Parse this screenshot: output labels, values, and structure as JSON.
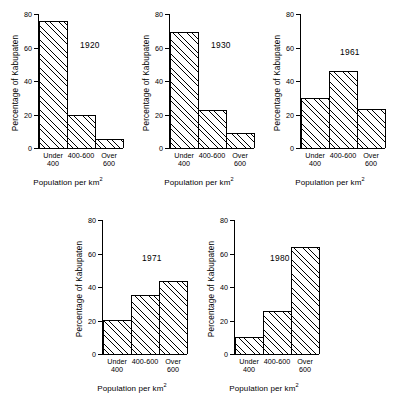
{
  "figure": {
    "axis": {
      "y_title": "Percentage of Kabupaten",
      "x_title_main": "Population per km",
      "x_title_sup": "2",
      "y_ticks": [
        "0",
        "20",
        "40",
        "60",
        "80"
      ]
    },
    "categories": [
      "Under\n400",
      "400-600",
      "Over\n600"
    ]
  },
  "chart_data": [
    {
      "type": "bar",
      "title": "1920",
      "categories": [
        "Under 400",
        "400-600",
        "Over 600"
      ],
      "values": [
        76,
        19.5,
        5.5
      ],
      "xlabel": "Population per km2",
      "ylabel": "Percentage of Kabupaten",
      "ylim": [
        0,
        80
      ],
      "yticks": [
        0,
        20,
        40,
        60,
        80
      ],
      "grid": false,
      "legend": "none"
    },
    {
      "type": "bar",
      "title": "1930",
      "categories": [
        "Under 400",
        "400-600",
        "Over 600"
      ],
      "values": [
        69,
        22.5,
        9
      ],
      "xlabel": "Population per km2",
      "ylabel": "Percentage of Kabupaten",
      "ylim": [
        0,
        80
      ],
      "yticks": [
        0,
        20,
        40,
        60,
        80
      ],
      "grid": false,
      "legend": "none"
    },
    {
      "type": "bar",
      "title": "1961",
      "categories": [
        "Under 400",
        "400-600",
        "Over 600"
      ],
      "values": [
        30,
        46,
        23
      ],
      "xlabel": "Population per km2",
      "ylabel": "Percentage of Kabupaten",
      "ylim": [
        0,
        80
      ],
      "yticks": [
        0,
        20,
        40,
        60,
        80
      ],
      "grid": false,
      "legend": "none"
    },
    {
      "type": "bar",
      "title": "1971",
      "categories": [
        "Under 400",
        "400-600",
        "Over 600"
      ],
      "values": [
        20.5,
        35,
        43.5
      ],
      "xlabel": "Population per km2",
      "ylabel": "Percentage of Kabupaten",
      "ylim": [
        0,
        80
      ],
      "yticks": [
        0,
        20,
        40,
        60,
        80
      ],
      "grid": false,
      "legend": "none"
    },
    {
      "type": "bar",
      "title": "1980",
      "categories": [
        "Under 400",
        "400-600",
        "Over 600"
      ],
      "values": [
        10,
        25.5,
        64
      ],
      "xlabel": "Population per km2",
      "ylabel": "Percentage of Kabupaten",
      "ylim": [
        0,
        80
      ],
      "yticks": [
        0,
        20,
        40,
        60,
        80
      ],
      "grid": false,
      "legend": "none"
    }
  ]
}
